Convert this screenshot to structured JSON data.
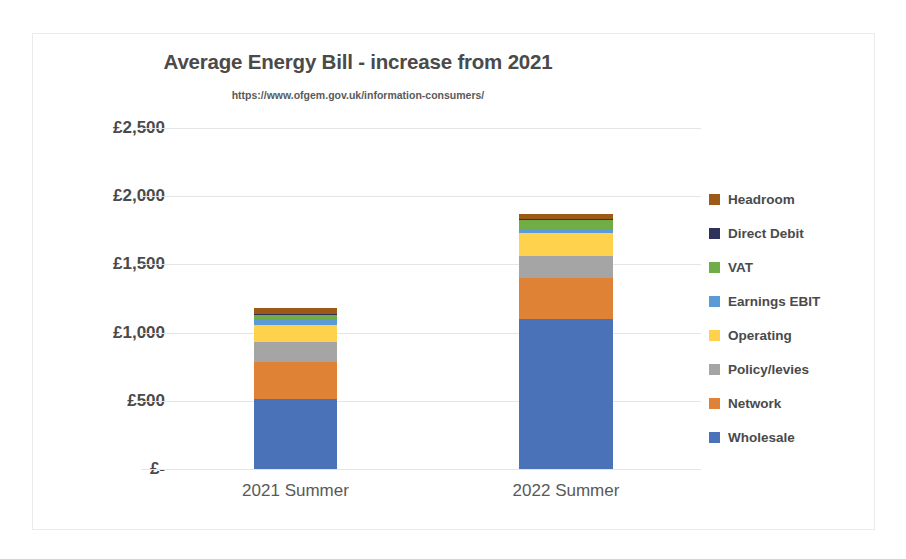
{
  "chart_data": {
    "type": "bar",
    "subtype": "stacked-column",
    "title": "Average Energy Bill - increase from 2021",
    "subtitle": "https://www.ofgem.gov.uk/information-consumers/",
    "xlabel": "",
    "ylabel": "",
    "categories": [
      "2021 Summer",
      "2022 Summer"
    ],
    "ylim": [
      0,
      2500
    ],
    "ytick_values": [
      0,
      500,
      1000,
      1500,
      2000,
      2500
    ],
    "ytick_labels": [
      "£-",
      "£500",
      "£1,000",
      "£1,500",
      "£2,000",
      "£2,500"
    ],
    "grid": true,
    "legend_position": "right",
    "legend_order": [
      "Headroom",
      "Direct Debit",
      "VAT",
      "Earnings EBIT",
      "Operating",
      "Policy/levies",
      "Network",
      "Wholesale"
    ],
    "stack_order_bottom_to_top": [
      "Wholesale",
      "Network",
      "Policy/levies",
      "Operating",
      "Earnings EBIT",
      "VAT",
      "Direct Debit",
      "Headroom"
    ],
    "series": [
      {
        "name": "Wholesale",
        "color": "#4A72B8",
        "values": [
          515,
          1103
        ]
      },
      {
        "name": "Network",
        "color": "#E08236",
        "values": [
          272,
          294
        ]
      },
      {
        "name": "Policy/levies",
        "color": "#A5A5A5",
        "values": [
          147,
          162
        ]
      },
      {
        "name": "Operating",
        "color": "#FFD24D",
        "values": [
          125,
          169
        ]
      },
      {
        "name": "Earnings EBIT",
        "color": "#5B9BD5",
        "values": [
          30,
          29
        ]
      },
      {
        "name": "VAT",
        "color": "#70AD47",
        "values": [
          37,
          66
        ]
      },
      {
        "name": "Direct Debit",
        "color": "#2E3159",
        "values": [
          8,
          8
        ]
      },
      {
        "name": "Headroom",
        "color": "#9C5A16",
        "values": [
          44,
          37
        ]
      }
    ],
    "totals": [
      1178,
      1868
    ]
  },
  "legend": [
    {
      "label": "Headroom",
      "color": "#9C5A16"
    },
    {
      "label": "Direct Debit",
      "color": "#2E3159"
    },
    {
      "label": "VAT",
      "color": "#70AD47"
    },
    {
      "label": "Earnings EBIT",
      "color": "#5B9BD5"
    },
    {
      "label": "Operating",
      "color": "#FFD24D"
    },
    {
      "label": "Policy/levies",
      "color": "#A5A5A5"
    },
    {
      "label": "Network",
      "color": "#E08236"
    },
    {
      "label": "Wholesale",
      "color": "#4A72B8"
    }
  ]
}
